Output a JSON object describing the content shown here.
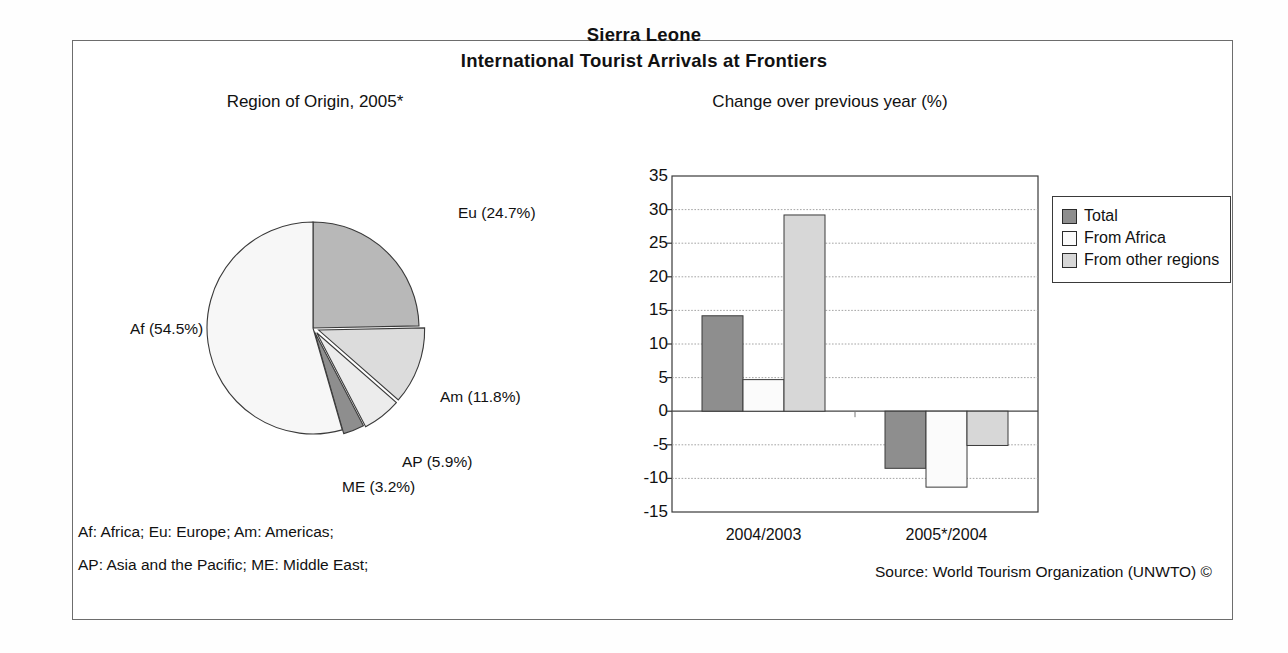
{
  "document": {
    "title_line1": "Sierra Leone",
    "title_line2": "International Tourist Arrivals at Frontiers",
    "footnote_line1": "Af: Africa; Eu: Europe; Am: Americas;",
    "footnote_line2": "AP: Asia and the Pacific; ME: Middle East;",
    "source": "Source: World Tourism Organization (UNWTO) ©"
  },
  "colors": {
    "dark_gray": "#8e8e8e",
    "light_gray": "#d7d7d7",
    "pale_gray": "#efefef",
    "near_white": "#fbfbfb",
    "outline": "#3a3a3a",
    "frame": "#6d6d6d"
  },
  "chart_data": [
    {
      "type": "pie",
      "title": "Region of Origin, 2005*",
      "categories": [
        "Eu",
        "Am",
        "AP",
        "ME",
        "Af"
      ],
      "values": [
        24.7,
        11.8,
        5.9,
        3.2,
        54.5
      ],
      "labels": [
        "Eu (24.7%)",
        "Am (11.8%)",
        "AP (5.9%)",
        "ME (3.2%)",
        "Af (54.5%)"
      ],
      "unit": "%",
      "start_angle_deg": 0,
      "direction": "clockwise",
      "slice_colors": [
        "#b8b8b8",
        "#dcdcdc",
        "#ececec",
        "#8e8e8e",
        "#f7f7f7"
      ],
      "legend": "none"
    },
    {
      "type": "bar",
      "title": "Change over previous year (%)",
      "categories": [
        "2004/2003",
        "2005*/2004"
      ],
      "series": [
        {
          "name": "Total",
          "values": [
            14.2,
            -8.5
          ],
          "color": "#8e8e8e"
        },
        {
          "name": "From Africa",
          "values": [
            4.7,
            -11.3
          ],
          "color": "#fbfbfb"
        },
        {
          "name": "From other regions",
          "values": [
            29.2,
            -5.1
          ],
          "color": "#d7d7d7"
        }
      ],
      "ylabel": "",
      "xlabel": "",
      "ylim": [
        -15,
        35
      ],
      "yticks": [
        35,
        30,
        25,
        20,
        15,
        10,
        5,
        0,
        -5,
        -10,
        -15
      ],
      "ytick_labels": [
        "35",
        "30",
        "25",
        "20",
        "15",
        "10",
        "5",
        "0",
        "-5",
        "-10",
        "-15"
      ],
      "grid": true,
      "grid_axis": "y",
      "legend_position": "right-outside"
    }
  ]
}
